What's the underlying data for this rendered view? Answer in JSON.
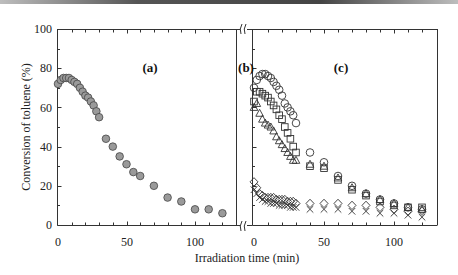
{
  "chart_data": {
    "type": "scatter",
    "ylabel": "Conversion of toluene (%)",
    "xlabel": "Irradiation time (min)",
    "ylim": [
      0,
      100
    ],
    "yticks": [
      0,
      20,
      40,
      60,
      80,
      100
    ],
    "xticks": [
      0,
      50,
      100
    ],
    "axis_break_between_panels": true,
    "panels": [
      {
        "label": "(a)",
        "xlim": [
          0,
          130
        ],
        "series": [
          {
            "name": "filled circles",
            "marker": "circle-filled",
            "color": "#9a9a9a",
            "x": [
              0,
              2,
              4,
              6,
              8,
              10,
              12,
              14,
              16,
              18,
              20,
              22,
              24,
              26,
              28,
              30,
              35,
              40,
              45,
              50,
              55,
              60,
              70,
              80,
              90,
              100,
              110,
              120
            ],
            "y": [
              72,
              74,
              75,
              75,
              75,
              74,
              73,
              72,
              70,
              68,
              66,
              65,
              63,
              61,
              58,
              55,
              44,
              40,
              35,
              31,
              27,
              25,
              20,
              14,
              12,
              8,
              8,
              6
            ]
          }
        ]
      },
      {
        "label": "(b)",
        "xlim": null,
        "series": []
      },
      {
        "label": "(c)",
        "xlim": [
          0,
          130
        ],
        "series": [
          {
            "name": "open circles",
            "marker": "circle-open",
            "x": [
              0,
              2,
              4,
              6,
              8,
              10,
              12,
              14,
              16,
              18,
              20,
              22,
              24,
              26,
              28,
              30,
              40,
              50,
              60,
              70,
              80,
              90,
              100,
              110,
              120
            ],
            "y": [
              70,
              74,
              76,
              77,
              77,
              76,
              75,
              73,
              71,
              69,
              66,
              62,
              60,
              58,
              56,
              52,
              37,
              32,
              25,
              20,
              16,
              13,
              11,
              9,
              8
            ]
          },
          {
            "name": "open squares",
            "marker": "square-open",
            "x": [
              0,
              2,
              4,
              6,
              8,
              10,
              12,
              14,
              16,
              18,
              20,
              22,
              24,
              26,
              28,
              30,
              40,
              50,
              60,
              70,
              80,
              90,
              100,
              110,
              120
            ],
            "y": [
              63,
              68,
              68,
              67,
              66,
              65,
              63,
              61,
              59,
              56,
              54,
              50,
              47,
              44,
              40,
              37,
              30,
              29,
              23,
              18,
              15,
              12,
              10,
              9,
              9
            ]
          },
          {
            "name": "open triangles",
            "marker": "triangle-open",
            "x": [
              0,
              2,
              4,
              6,
              8,
              10,
              12,
              14,
              16,
              18,
              20,
              22,
              24,
              26,
              28,
              30,
              40,
              50,
              60,
              70,
              80,
              90,
              100,
              110,
              120
            ],
            "y": [
              60,
              62,
              57,
              54,
              52,
              51,
              50,
              48,
              45,
              43,
              41,
              39,
              37,
              35,
              33,
              33,
              31,
              30,
              24,
              19,
              16,
              13,
              11,
              9,
              8
            ]
          },
          {
            "name": "open diamonds",
            "marker": "diamond-open",
            "x": [
              0,
              2,
              4,
              6,
              8,
              10,
              12,
              14,
              16,
              18,
              20,
              22,
              24,
              26,
              28,
              30,
              40,
              50,
              60,
              70,
              80,
              90,
              100,
              110,
              120
            ],
            "y": [
              22,
              19,
              16,
              15,
              14,
              14,
              14,
              14,
              13,
              13,
              13,
              13,
              12,
              12,
              12,
              11,
              11,
              11,
              11,
              10,
              10,
              9,
              8,
              7,
              7
            ]
          },
          {
            "name": "crosses",
            "marker": "x",
            "x": [
              0,
              2,
              4,
              6,
              8,
              10,
              12,
              14,
              16,
              18,
              20,
              22,
              24,
              26,
              28,
              30,
              40,
              50,
              60,
              70,
              80,
              90,
              100,
              110,
              120
            ],
            "y": [
              18,
              16,
              14,
              13,
              12,
              12,
              11,
              11,
              11,
              10,
              10,
              10,
              10,
              9,
              9,
              9,
              8,
              8,
              8,
              7,
              7,
              6,
              6,
              5,
              4
            ]
          }
        ]
      }
    ]
  },
  "labels": {
    "ylabel": "Conversion of toluene (%)",
    "xlabel": "Irradiation time (min)",
    "panel_a": "(a)",
    "panel_b": "(b)",
    "panel_c": "(c)",
    "yt0": "0",
    "yt20": "20",
    "yt40": "40",
    "yt60": "60",
    "yt80": "80",
    "yt100": "100",
    "xa0": "0",
    "xa50": "50",
    "xa100": "100",
    "xc0": "0",
    "xc50": "50",
    "xc100": "100"
  }
}
